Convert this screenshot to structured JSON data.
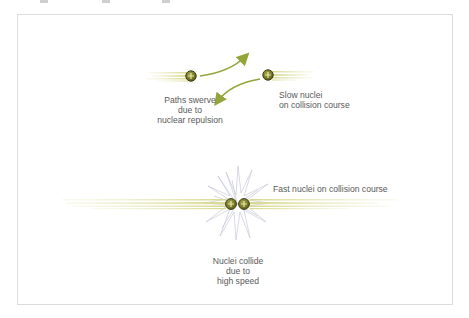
{
  "diagram": {
    "title": "",
    "colors": {
      "trail": "#e4e6b0",
      "trail_dark": "#c9cc78",
      "nucleus_fill": "#7a7a2a",
      "nucleus_ring": "#3d3d10",
      "plus": "#e6e6a0",
      "arrow": "#94a63a",
      "burst": "#c8c8d8",
      "text": "#5a5a5a",
      "frame": "#dcdcdc"
    },
    "slow_scenario": {
      "left_label": [
        "Paths swerve",
        "due to",
        "nuclear repulsion"
      ],
      "right_label": [
        "Slow nuclei",
        "on collision course"
      ]
    },
    "fast_scenario": {
      "right_label": "Fast nuclei on collision course",
      "bottom_label": [
        "Nuclei collide",
        "due to",
        "high speed"
      ]
    },
    "nucleus_symbol": "+"
  }
}
